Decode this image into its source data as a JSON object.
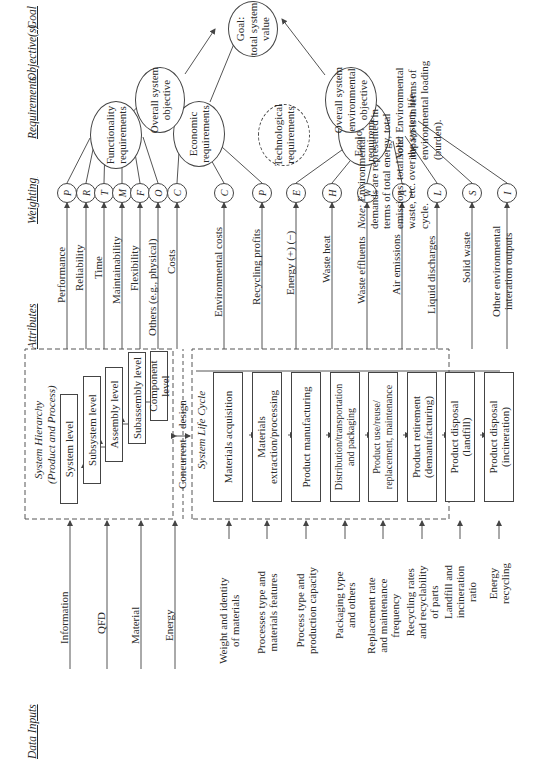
{
  "headers": {
    "data_inputs": "Data Inputs",
    "attributes": "Attributes",
    "weighting": "Weighting",
    "requirements": "Requirements",
    "objectives": "Objective(s)",
    "goal": "Goal"
  },
  "data_inputs": {
    "top": [
      "Information",
      "QFD",
      "Material",
      "Energy"
    ],
    "bottom": [
      "Weight and identity\nof materials",
      "Processes type and\nmaterials features",
      "Process type and\nproduction capacity",
      "Packaging type\nand others",
      "Replacement rate\nand maintenance\nfrequency",
      "Recycling rates\nand recyclability\nof parts",
      "Landfill and\nincineration\nratio",
      "Energy\nrecycling"
    ]
  },
  "system_hierarchy": {
    "title": "System Hierarchy",
    "subtitle": "(Product and Process)",
    "levels": [
      "System level",
      "Subsystem level",
      "Assembly level",
      "Subassembly level",
      "Component level"
    ]
  },
  "concurrent_design": {
    "left": "Concurrent",
    "right": "design"
  },
  "system_life_cycle": {
    "title": "System Life Cycle",
    "stages": [
      "Materials acquisition",
      "Materials\nextraction/processing",
      "Product manufacturing",
      "Distribution/transportation\nand packaging",
      "Product use/reuse/\nreplacement, maintenance",
      "Product retirement\n(demanufacturing)",
      "Product disposal\n(landfill)",
      "Product disposal\n(incineration)"
    ]
  },
  "attributes": [
    {
      "label": "Performance",
      "weight": "P"
    },
    {
      "label": "Reliability",
      "weight": "R"
    },
    {
      "label": "Time",
      "weight": "T"
    },
    {
      "label": "Maintainability",
      "weight": "M"
    },
    {
      "label": "Flexibility",
      "weight": "F"
    },
    {
      "label": "Others (e.g., physical)",
      "weight": "O"
    },
    {
      "label": "Costs",
      "weight": "C"
    },
    {
      "label": "Environmental costs",
      "weight": "C"
    },
    {
      "label": "Recycling profits",
      "weight": "P"
    },
    {
      "label": "Energy (+) (−)",
      "weight": "E"
    },
    {
      "label": "Waste heat",
      "weight": "H"
    },
    {
      "label": "Waste effluents",
      "weight": "W"
    },
    {
      "label": "Air emissions",
      "weight": "A"
    },
    {
      "label": "Liquid discharges",
      "weight": "L"
    },
    {
      "label": "Solid waste",
      "weight": "S"
    },
    {
      "label": "Other environmental\ninteration outputs",
      "weight": "I"
    }
  ],
  "requirements": {
    "functionality": "Functionality\nrequirements",
    "economic": "Economic\nrequirements",
    "technological": "Technological\nrequirements",
    "ecological": "Ecological\nrequirements"
  },
  "objectives": {
    "overall_system": "Overall system\nobjective",
    "overall_environmental": "Overall system\nenvironmental\nobjective"
  },
  "goal": "Goal:\ntotal system\nvalue",
  "notes": {
    "environmental_impact": {
      "prefix": "Note:",
      "text": " Environmental\nimpact is in terms of\nenvironmental loading\n(burden)."
    },
    "environmental_demands": {
      "prefix": "Note:",
      "text": " Environmental\ndemands are represented in\nterms of total energy, total\nemissions, total solid\nwaste, etc. over the system life\ncycle."
    }
  }
}
